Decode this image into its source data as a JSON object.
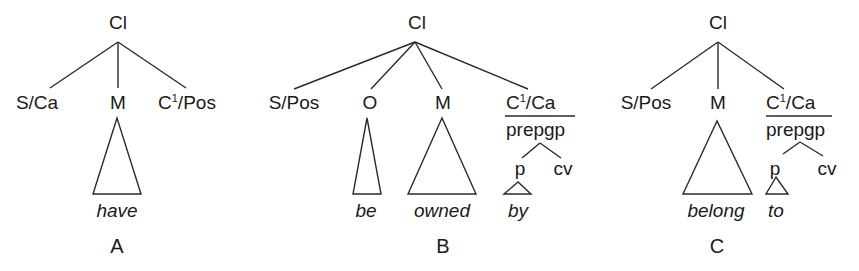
{
  "figure": {
    "trees": [
      {
        "caption": "A",
        "root": "Cl",
        "children": [
          "S/Ca",
          "M",
          "C¹/Pos"
        ],
        "c3_base": "C",
        "c3_sup": "1",
        "c3_rest": "/Pos",
        "words": [
          "have"
        ]
      },
      {
        "caption": "B",
        "root": "Cl",
        "children": [
          "S/Pos",
          "O",
          "M",
          "C¹/Ca"
        ],
        "c4_base": "C",
        "c4_sup": "1",
        "c4_rest": "/Ca",
        "phrase": "prepgp",
        "phrase_children": [
          "p",
          "cv"
        ],
        "words": [
          "be",
          "owned",
          "by"
        ]
      },
      {
        "caption": "C",
        "root": "Cl",
        "children": [
          "S/Pos",
          "M",
          "C¹/Ca"
        ],
        "c3_base": "C",
        "c3_sup": "1",
        "c3_rest": "/Ca",
        "phrase": "prepgp",
        "phrase_children": [
          "p",
          "cv"
        ],
        "words": [
          "belong",
          "to"
        ]
      }
    ]
  }
}
